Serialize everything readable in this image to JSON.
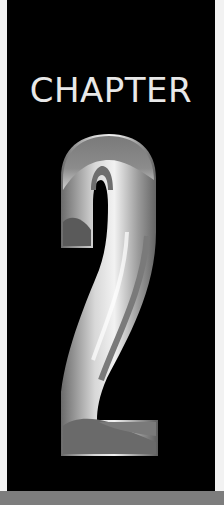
{
  "chapter": {
    "label": "CHAPTER",
    "number": "2"
  },
  "colors": {
    "background": "#000000",
    "text": "#e8e8e8",
    "bar": "#7d7d7d"
  }
}
